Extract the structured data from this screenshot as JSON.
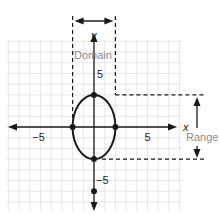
{
  "figure": {
    "x_axis_label": "x",
    "y_axis_label": "y",
    "x_tick_labels": [
      {
        "value": -5,
        "text": "−5"
      },
      {
        "value": 5,
        "text": "5"
      }
    ],
    "y_tick_labels": [
      {
        "value": 5,
        "text": "5"
      },
      {
        "value": -5,
        "text": "−5"
      }
    ],
    "domain_label": "Domain",
    "range_label": "Range",
    "grid": true,
    "x_range": [
      -8,
      8
    ],
    "y_range": [
      -8,
      8
    ],
    "ellipse": {
      "center": [
        0,
        0
      ],
      "semi_x": 2,
      "semi_y": 3
    },
    "points": [
      {
        "x": 0,
        "y": 3
      },
      {
        "x": -2,
        "y": 0
      },
      {
        "x": 2,
        "y": 0
      },
      {
        "x": 0,
        "y": -3
      },
      {
        "x": 0,
        "y": -6
      }
    ],
    "domain": [
      -2,
      2
    ],
    "range": [
      -3,
      3
    ],
    "colors": {
      "curve": "#1a1a1a",
      "grid": "#dcdcdc",
      "annotation": "#8a8a8a"
    }
  }
}
